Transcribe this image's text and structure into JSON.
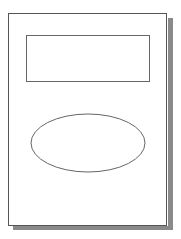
{
  "page": {
    "label": "",
    "border_color": "#555555",
    "shadow_color": "#8a8a8a"
  },
  "shapes": {
    "rectangle": {
      "label": "",
      "stroke": "#666666"
    },
    "ellipse": {
      "label": "",
      "stroke": "#666666",
      "cx": 88,
      "cy": 143,
      "rx": 57,
      "ry": 29
    }
  }
}
